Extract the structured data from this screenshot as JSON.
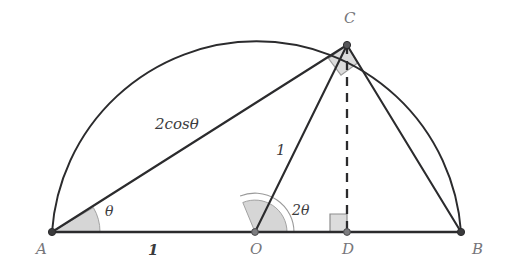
{
  "figure": {
    "background_color": "#ffffff",
    "stroke_color": "#2b2b2d",
    "fill_color": "#d9d9d9",
    "label_color": "#6e6e70",
    "vertices": [
      {
        "name": "A",
        "label": "A",
        "x": 52,
        "y": 232
      },
      {
        "name": "O",
        "label": "O",
        "x": 255,
        "y": 232
      },
      {
        "name": "D",
        "label": "D",
        "x": 347,
        "y": 232
      },
      {
        "name": "B",
        "label": "B",
        "x": 461,
        "y": 232
      },
      {
        "name": "C",
        "label": "C",
        "x": 347,
        "y": 45
      }
    ],
    "labels": {
      "vertex_a": "A",
      "vertex_o": "O",
      "vertex_d": "D",
      "vertex_b": "B",
      "vertex_c": "C",
      "segment_ac": "2cosθ",
      "segment_oc": "1",
      "segment_ao": "1",
      "angle_a": "θ",
      "angle_o": "2θ"
    },
    "segments": [
      {
        "name": "base-ab",
        "from": "A",
        "to": "B",
        "style": "solid"
      },
      {
        "name": "chord-ac",
        "from": "A",
        "to": "C",
        "style": "solid"
      },
      {
        "name": "radius-oc",
        "from": "O",
        "to": "C",
        "style": "solid"
      },
      {
        "name": "chord-cb",
        "from": "C",
        "to": "B",
        "style": "solid"
      },
      {
        "name": "altitude-cd",
        "from": "C",
        "to": "D",
        "style": "dashed"
      }
    ],
    "arc": {
      "name": "semicircle-arc",
      "center_x": 255,
      "center_y": 232,
      "radius": 205
    },
    "angles": [
      {
        "name": "angle-at-a",
        "vertex": "A",
        "value": "θ",
        "arcs": 1
      },
      {
        "name": "angle-at-o",
        "vertex": "O",
        "value": "2θ",
        "arcs": 2
      },
      {
        "name": "right-angle-at-c",
        "vertex": "C",
        "value": "90",
        "marker": "square"
      },
      {
        "name": "right-angle-at-d",
        "vertex": "D",
        "value": "90",
        "marker": "square"
      }
    ]
  }
}
